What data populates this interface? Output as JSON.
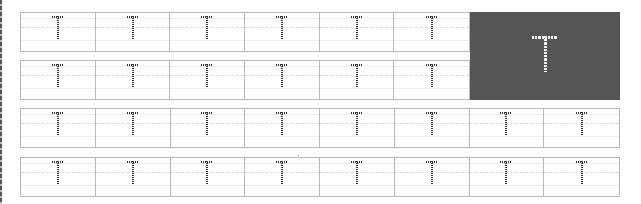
{
  "worksheet": {
    "letter": "T",
    "colors": {
      "trace_dots": "#333333",
      "model_background": "#555555",
      "model_letter": "#f4f4f4",
      "box_border": "#b8b8b8"
    },
    "rows": [
      {
        "cells": [
          "T",
          "T",
          "T",
          "T",
          "T",
          "T"
        ],
        "has_model": true
      },
      {
        "cells": [
          "T",
          "T",
          "T",
          "T",
          "T",
          "T"
        ],
        "has_model": true
      },
      {
        "cells": [
          "T",
          "T",
          "T",
          "T",
          "T",
          "T",
          "T",
          "T"
        ],
        "has_model": false
      },
      {
        "cells": [
          "T",
          "T",
          "T",
          "T",
          "T",
          "T",
          "T",
          "T"
        ],
        "has_model": false
      }
    ],
    "model": {
      "letter": "T"
    }
  }
}
